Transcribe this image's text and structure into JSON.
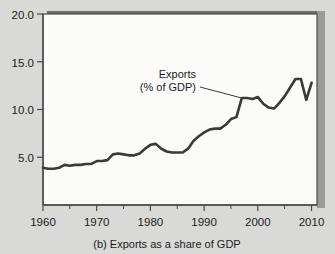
{
  "figure": {
    "caption": "(b) Exports as a share of GDP",
    "panel_letter": "(b)"
  },
  "colors": {
    "paper_background": "#d9d9d7",
    "plot_background": "#fbfbfa",
    "line": "#3a3a3a",
    "axis": "#4a4a4a",
    "text": "#1c1c1c",
    "frame_top_band": "#6e6e6e",
    "frame_shadow": "#9a9a98"
  },
  "chart_data": {
    "type": "line",
    "title": "(b) Exports as a share of GDP",
    "xlabel": "",
    "ylabel": "",
    "xlim": [
      1960,
      2011
    ],
    "ylim": [
      0,
      20
    ],
    "grid": false,
    "legend": "none",
    "y_ticks": [
      5.0,
      10.0,
      15.0,
      20.0
    ],
    "y_tick_labels": [
      "5.0",
      "10.0",
      "15.0",
      "20.0"
    ],
    "x_ticks": [
      1960,
      1970,
      1980,
      1990,
      2000,
      2010
    ],
    "x_tick_labels": [
      "1960",
      "1970",
      "1980",
      "1990",
      "2000",
      "2010"
    ],
    "x_minor_ticks": [
      1965,
      1975,
      1985,
      1995,
      2005
    ],
    "annotations": [
      {
        "text_line1": "Exports",
        "text_line2": "(% of GDP)",
        "points_to_year": 1997,
        "points_to_value": 11.2
      }
    ],
    "series": [
      {
        "name": "Exports (% of GDP)",
        "x": [
          1960,
          1961,
          1962,
          1963,
          1964,
          1965,
          1966,
          1967,
          1968,
          1969,
          1970,
          1971,
          1972,
          1973,
          1974,
          1975,
          1976,
          1977,
          1978,
          1979,
          1980,
          1981,
          1982,
          1983,
          1984,
          1985,
          1986,
          1987,
          1988,
          1989,
          1990,
          1991,
          1992,
          1993,
          1994,
          1995,
          1996,
          1997,
          1998,
          1999,
          2000,
          2001,
          2002,
          2003,
          2004,
          2005,
          2006,
          2007,
          2008,
          2009,
          2010
        ],
        "values": [
          3.9,
          3.8,
          3.8,
          3.9,
          4.2,
          4.1,
          4.2,
          4.2,
          4.3,
          4.3,
          4.6,
          4.6,
          4.7,
          5.3,
          5.4,
          5.3,
          5.2,
          5.2,
          5.4,
          5.9,
          6.3,
          6.4,
          5.9,
          5.6,
          5.5,
          5.5,
          5.5,
          5.9,
          6.7,
          7.2,
          7.6,
          7.9,
          8.0,
          8.0,
          8.4,
          9.0,
          9.2,
          11.2,
          11.2,
          11.1,
          11.3,
          10.6,
          10.2,
          10.1,
          10.7,
          11.4,
          12.3,
          13.2,
          13.2,
          11.0,
          12.8
        ]
      }
    ]
  }
}
